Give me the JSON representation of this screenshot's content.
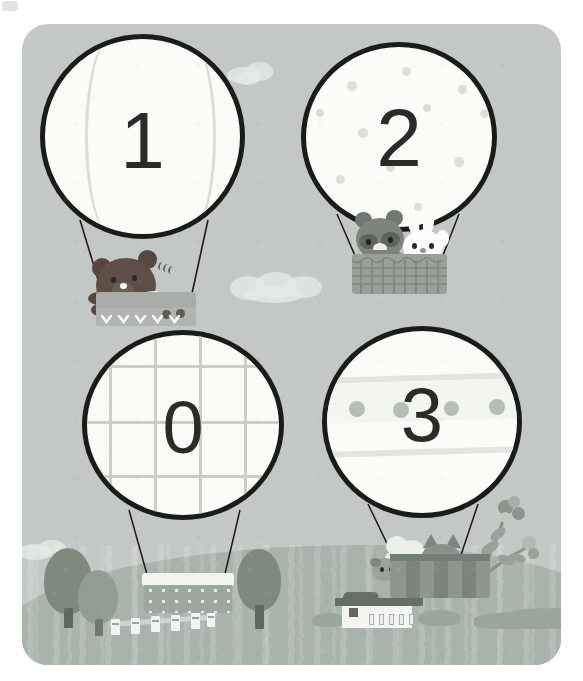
{
  "scene": {
    "title": "Hot Air Balloons Number Card",
    "background_color": "#ffffff",
    "card_color": "#c3c8c6",
    "ground_color": "#aab3ab",
    "outline_color": "#1b1b1b",
    "numeral_color": "#2b2b2b"
  },
  "balloons": [
    {
      "id": "balloon-one",
      "number": "1",
      "pattern": "vertical-panels",
      "envelope_color": "#fbfbf8",
      "pattern_color": "#d9ddd6",
      "basket": {
        "style": "chevron-box",
        "color": "#a8adaa",
        "trim_color": "#ffffff"
      },
      "passengers": [
        "bear"
      ]
    },
    {
      "id": "balloon-two",
      "number": "2",
      "pattern": "polka-dots",
      "envelope_color": "#fbfbf8",
      "pattern_color": "#dcdfd9",
      "basket": {
        "style": "woven",
        "color": "#9a9f99",
        "trim_color": "#8a908a"
      },
      "passengers": [
        "raccoon",
        "rabbit"
      ]
    },
    {
      "id": "balloon-zero",
      "number": "0",
      "pattern": "grid-plaid",
      "envelope_color": "#fbfbf8",
      "pattern_color": "#c9cec7",
      "basket": {
        "style": "scallop-box",
        "color": "#9fa6a0",
        "trim_color": "#f3f4f0"
      },
      "passengers": []
    },
    {
      "id": "balloon-three",
      "number": "3",
      "pattern": "horizontal-stripes-dots",
      "envelope_color": "#fbfbf8",
      "pattern_color": "#e2e5df",
      "basket": {
        "style": "striped-box",
        "color": "#8e958e",
        "trim_color": "#757d76"
      },
      "passengers": [
        "sheep",
        "cat",
        "flowers"
      ]
    }
  ],
  "landscape": {
    "trees": [
      {
        "name": "tree-left-tall",
        "crown_color": "#7e8a80",
        "trunk_color": "#5e685f"
      },
      {
        "name": "tree-left-short",
        "crown_color": "#929c93",
        "trunk_color": "#6f7a70"
      },
      {
        "name": "tree-middle",
        "crown_color": "#7e8a80",
        "trunk_color": "#5e685f"
      }
    ],
    "fence": {
      "name": "white-picket-fence",
      "post_color": "#f1f3f0",
      "rail_color": "#cfd4cf",
      "post_count": 6
    },
    "barn": {
      "name": "farm-barn",
      "wall_color": "#f4f5f2",
      "roof_color": "#656f66",
      "window_count": 5
    },
    "bushes_color": "#9aa69c",
    "hill_color": "#aab3ab"
  },
  "clouds": [
    {
      "name": "cloud-top-right"
    },
    {
      "name": "cloud-middle"
    },
    {
      "name": "cloud-left-low"
    },
    {
      "name": "cloud-right-low"
    }
  ]
}
